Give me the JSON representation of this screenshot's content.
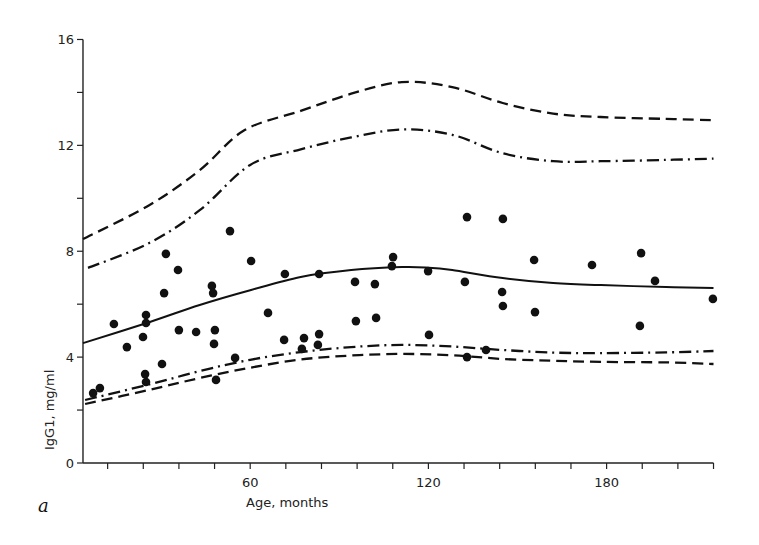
{
  "chart_data": {
    "type": "scatter",
    "title": "",
    "panel_label": "a",
    "xlabel": "Age, months",
    "ylabel": "IgG1, mg/ml",
    "xlim": [
      3.7,
      216
    ],
    "ylim": [
      0,
      16
    ],
    "x_ticks_major": [
      60,
      120,
      180
    ],
    "x_tick_step": 12,
    "y_ticks_major": [
      0,
      4,
      8,
      12,
      16
    ],
    "y_tick_step": 2,
    "grid": false,
    "legend": null,
    "series": [
      {
        "name": "observations",
        "kind": "points",
        "points": [
          [
            7.1,
            2.64
          ],
          [
            9.4,
            2.83
          ],
          [
            14.1,
            5.25
          ],
          [
            18.5,
            4.38
          ],
          [
            23.9,
            4.76
          ],
          [
            24.9,
            5.59
          ],
          [
            24.9,
            5.29
          ],
          [
            24.6,
            3.36
          ],
          [
            24.9,
            3.06
          ],
          [
            30.3,
            3.74
          ],
          [
            31.0,
            6.42
          ],
          [
            31.6,
            7.9
          ],
          [
            35.7,
            7.29
          ],
          [
            36.0,
            5.02
          ],
          [
            41.8,
            4.95
          ],
          [
            47.1,
            6.69
          ],
          [
            47.5,
            6.42
          ],
          [
            48.1,
            5.02
          ],
          [
            47.8,
            4.5
          ],
          [
            48.5,
            3.14
          ],
          [
            53.2,
            8.76
          ],
          [
            54.9,
            3.97
          ],
          [
            60.3,
            7.63
          ],
          [
            66.0,
            5.67
          ],
          [
            71.7,
            7.14
          ],
          [
            71.4,
            4.65
          ],
          [
            78.1,
            4.72
          ],
          [
            77.4,
            4.31
          ],
          [
            83.2,
            7.14
          ],
          [
            83.2,
            4.87
          ],
          [
            82.8,
            4.46
          ],
          [
            95.3,
            6.84
          ],
          [
            95.6,
            5.36
          ],
          [
            102.0,
            6.76
          ],
          [
            102.4,
            5.48
          ],
          [
            108.1,
            7.78
          ],
          [
            107.7,
            7.44
          ],
          [
            119.9,
            7.25
          ],
          [
            120.2,
            4.84
          ],
          [
            133.0,
            9.29
          ],
          [
            132.3,
            6.84
          ],
          [
            133.0,
            4.0
          ],
          [
            139.4,
            4.27
          ],
          [
            145.1,
            9.22
          ],
          [
            144.8,
            6.46
          ],
          [
            145.1,
            5.93
          ],
          [
            155.6,
            7.67
          ],
          [
            155.9,
            5.7
          ],
          [
            175.1,
            7.48
          ],
          [
            191.6,
            7.93
          ],
          [
            191.2,
            5.18
          ],
          [
            196.3,
            6.88
          ],
          [
            215.8,
            6.2
          ]
        ]
      },
      {
        "name": "mean",
        "kind": "line",
        "style": "solid",
        "points": [
          [
            3.7,
            4.53
          ],
          [
            26,
            5.32
          ],
          [
            43,
            5.97
          ],
          [
            60,
            6.53
          ],
          [
            77,
            7.03
          ],
          [
            94,
            7.29
          ],
          [
            111,
            7.4
          ],
          [
            120,
            7.38
          ],
          [
            128,
            7.29
          ],
          [
            145,
            6.99
          ],
          [
            162,
            6.8
          ],
          [
            178,
            6.72
          ],
          [
            200,
            6.65
          ],
          [
            216,
            6.61
          ]
        ]
      },
      {
        "name": "upper-outer",
        "kind": "line",
        "style": "dashed",
        "points": [
          [
            3.7,
            8.46
          ],
          [
            26,
            9.74
          ],
          [
            43,
            11.06
          ],
          [
            58,
            12.57
          ],
          [
            77,
            13.3
          ],
          [
            94,
            13.95
          ],
          [
            111,
            14.39
          ],
          [
            128,
            14.2
          ],
          [
            145,
            13.6
          ],
          [
            162,
            13.2
          ],
          [
            178,
            13.07
          ],
          [
            200,
            13.0
          ],
          [
            216,
            12.95
          ]
        ]
      },
      {
        "name": "upper-inner",
        "kind": "line",
        "style": "dashdot",
        "points": [
          [
            5.4,
            7.37
          ],
          [
            26,
            8.31
          ],
          [
            43,
            9.55
          ],
          [
            60,
            11.26
          ],
          [
            77,
            11.85
          ],
          [
            94,
            12.3
          ],
          [
            111,
            12.6
          ],
          [
            128,
            12.4
          ],
          [
            145,
            11.7
          ],
          [
            162,
            11.4
          ],
          [
            178,
            11.4
          ],
          [
            200,
            11.45
          ],
          [
            216,
            11.5
          ]
        ]
      },
      {
        "name": "lower-inner",
        "kind": "line",
        "style": "dashdot",
        "points": [
          [
            4.4,
            2.38
          ],
          [
            26,
            2.97
          ],
          [
            43,
            3.47
          ],
          [
            60,
            3.9
          ],
          [
            77,
            4.19
          ],
          [
            94,
            4.38
          ],
          [
            111,
            4.46
          ],
          [
            128,
            4.4
          ],
          [
            145,
            4.27
          ],
          [
            162,
            4.17
          ],
          [
            178,
            4.15
          ],
          [
            200,
            4.18
          ],
          [
            216,
            4.23
          ]
        ]
      },
      {
        "name": "lower-outer",
        "kind": "line",
        "style": "dashed",
        "points": [
          [
            4.4,
            2.23
          ],
          [
            26,
            2.76
          ],
          [
            43,
            3.21
          ],
          [
            60,
            3.6
          ],
          [
            77,
            3.91
          ],
          [
            94,
            4.06
          ],
          [
            111,
            4.12
          ],
          [
            128,
            4.07
          ],
          [
            145,
            3.93
          ],
          [
            162,
            3.86
          ],
          [
            178,
            3.82
          ],
          [
            200,
            3.8
          ],
          [
            216,
            3.74
          ]
        ]
      }
    ]
  },
  "labels": {
    "panel": "a",
    "x_axis": "Age, months",
    "y_axis": "IgG1, mg/ml"
  }
}
